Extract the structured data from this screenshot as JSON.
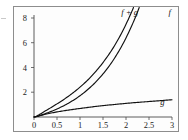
{
  "figure": {
    "name": "function-sum-plot",
    "background_color": "#fdfdfd",
    "frame_color": "#8d8d8d",
    "curve_color": "#111111"
  },
  "chart_data": {
    "type": "line",
    "title": "",
    "xlabel": "",
    "ylabel": "",
    "xlim": [
      0,
      3
    ],
    "ylim": [
      0,
      8.6
    ],
    "grid": false,
    "legend_position": "inline-curve-labels",
    "x_ticks": [
      0,
      0.5,
      1,
      1.5,
      2,
      2.5,
      3
    ],
    "x_tick_labels": [
      "0",
      "0.5",
      "1",
      "1.5",
      "2",
      "2.5",
      "3"
    ],
    "y_ticks": [
      2,
      4,
      6,
      8
    ],
    "y_tick_labels": [
      "2",
      "4",
      "6",
      "8"
    ],
    "x": [
      0,
      0.25,
      0.5,
      0.75,
      1,
      1.25,
      1.5,
      1.75,
      2,
      2.25,
      2.5,
      2.75,
      3
    ],
    "series": [
      {
        "name": "f",
        "label": "f",
        "label_x": 2.95,
        "label_y": 8.25,
        "values": [
          0,
          0.28,
          0.65,
          1.12,
          1.72,
          2.49,
          3.48,
          4.75,
          6.39,
          8.49,
          11.18,
          14.62,
          19.09
        ]
      },
      {
        "name": "g",
        "label": "g",
        "label_x": 2.79,
        "label_y": 1.0,
        "values": [
          0,
          0.22,
          0.41,
          0.56,
          0.69,
          0.81,
          0.92,
          1.01,
          1.1,
          1.18,
          1.25,
          1.32,
          1.39
        ]
      },
      {
        "name": "f + g",
        "label": "f + g",
        "label_x": 2.08,
        "label_y": 8.25,
        "values": [
          0,
          0.5,
          1.06,
          1.68,
          2.41,
          3.3,
          4.4,
          5.76,
          7.49,
          9.67,
          12.43,
          15.94,
          20.48
        ]
      }
    ]
  }
}
